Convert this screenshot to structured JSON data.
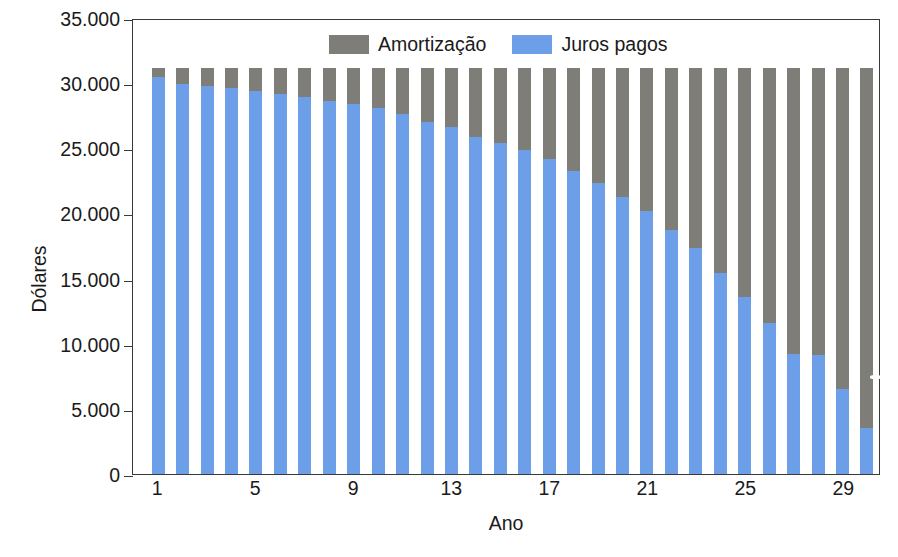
{
  "chart_data": {
    "type": "bar",
    "stacked": true,
    "title": "",
    "subtitle": "",
    "xlabel": "Ano",
    "ylabel": "Dólares",
    "ylim": [
      0,
      35000
    ],
    "ytick_values": [
      0,
      5000,
      10000,
      15000,
      20000,
      25000,
      30000,
      35000
    ],
    "ytick_labels": [
      "0",
      "5.000",
      "10.000",
      "15.000",
      "20.000",
      "25.000",
      "30.000",
      "35.000"
    ],
    "xtick_values": [
      1,
      5,
      9,
      13,
      17,
      21,
      25,
      29
    ],
    "xtick_labels": [
      "1",
      "5",
      "9",
      "13",
      "17",
      "21",
      "25",
      "29"
    ],
    "grid": false,
    "legend_position": "top-center",
    "categories": [
      1,
      2,
      3,
      4,
      5,
      6,
      7,
      8,
      9,
      10,
      11,
      12,
      13,
      14,
      15,
      16,
      17,
      18,
      19,
      20,
      21,
      22,
      23,
      24,
      25,
      26,
      27,
      28,
      29,
      30
    ],
    "bar_total": 31200,
    "series": [
      {
        "name": "Juros pagos",
        "color": "#6d9ee8",
        "values": [
          30500,
          29950,
          29800,
          29600,
          29400,
          29150,
          28900,
          28600,
          28400,
          28100,
          27600,
          27000,
          26600,
          25900,
          25400,
          24900,
          24150,
          23250,
          22300,
          21300,
          20200,
          18700,
          17350,
          15450,
          13600,
          11600,
          9200,
          9150,
          6500,
          3500
        ]
      },
      {
        "name": "Amortização",
        "color": "#7f7d78",
        "values": [
          700,
          1250,
          1400,
          1600,
          1800,
          2050,
          2300,
          2600,
          2800,
          3100,
          3600,
          4200,
          4600,
          5300,
          5800,
          6300,
          7050,
          7950,
          8900,
          9900,
          11000,
          12500,
          13850,
          15750,
          17600,
          19600,
          22000,
          22050,
          24700,
          27700
        ]
      }
    ]
  },
  "legend": {
    "entries": [
      {
        "label": "Amortização",
        "color": "#7f7d78",
        "swatch_name": "legend-swatch-amortizacao"
      },
      {
        "label": "Juros pagos",
        "color": "#6d9ee8",
        "swatch_name": "legend-swatch-juros"
      }
    ]
  }
}
